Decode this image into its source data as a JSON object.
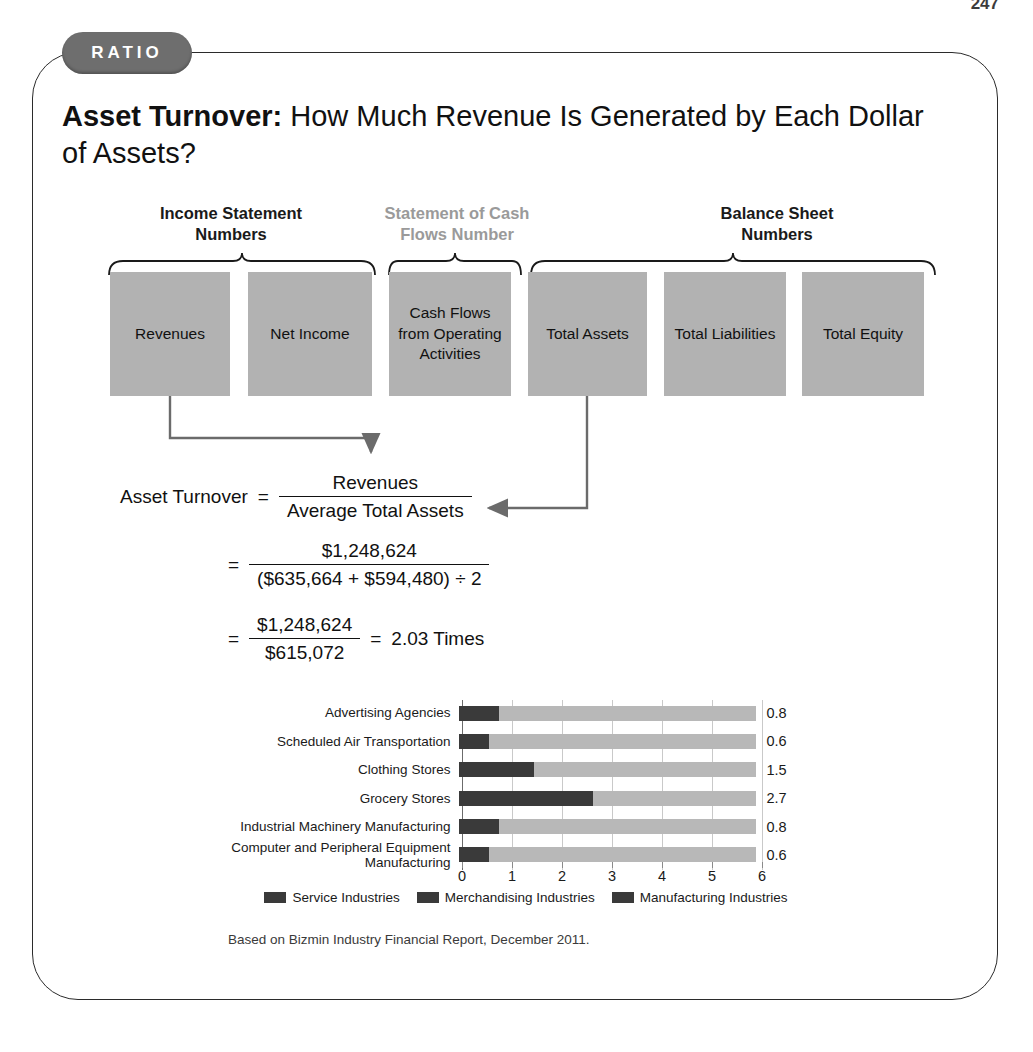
{
  "page_number": "247",
  "badge": {
    "label": "RATIO"
  },
  "title": {
    "lead": "Asset Turnover:",
    "rest": " How Much Revenue Is Generated by Each Dollar of Assets?"
  },
  "groups": [
    {
      "label": "Income Statement\nNumbers",
      "line1": "Income Statement",
      "line2": "Numbers",
      "muted": false
    },
    {
      "label": "Statement of Cash\nFlows Number",
      "line1": "Statement of Cash",
      "line2": "Flows Number",
      "muted": true
    },
    {
      "label": "Balance Sheet\nNumbers",
      "line1": "Balance Sheet",
      "line2": "Numbers",
      "muted": false
    }
  ],
  "boxes": [
    {
      "label": "Revenues"
    },
    {
      "label": "Net Income"
    },
    {
      "label": "Cash Flows from Operating Activities"
    },
    {
      "label": "Total Assets"
    },
    {
      "label": "Total Liabilities"
    },
    {
      "label": "Total Equity"
    }
  ],
  "formula": {
    "name": "Asset Turnover",
    "equals": "=",
    "numerator": "Revenues",
    "denominator": "Average Total Assets",
    "step2_numerator": "$1,248,624",
    "step2_denominator": "($635,664 + $594,480) ÷ 2",
    "step3_numerator": "$1,248,624",
    "step3_denominator": "$615,072",
    "result": "2.03 Times"
  },
  "chart_data": {
    "type": "bar",
    "orientation": "horizontal",
    "categories": [
      "Advertising Agencies",
      "Scheduled Air Transportation",
      "Clothing Stores",
      "Grocery Stores",
      "Industrial Machinery Manufacturing",
      "Computer and Peripheral Equipment Manufacturing"
    ],
    "values": [
      0.8,
      0.6,
      1.5,
      2.7,
      0.8,
      0.6
    ],
    "value_labels": [
      "0.8",
      "0.6",
      "1.5",
      "2.7",
      "0.8",
      "0.6"
    ],
    "series": [
      {
        "name": "Asset Turnover",
        "values": [
          0.8,
          0.6,
          1.5,
          2.7,
          0.8,
          0.6
        ]
      }
    ],
    "xlim": [
      0,
      6
    ],
    "xticks": [
      0,
      1,
      2,
      3,
      4,
      5,
      6
    ],
    "xtick_labels": [
      "0",
      "1",
      "2",
      "3",
      "4",
      "5",
      "6"
    ],
    "title": "",
    "xlabel": "",
    "ylabel": "",
    "grid": true,
    "legend_position": "bottom",
    "legend": [
      {
        "label": "Service Industries",
        "color": "#3a3a3a"
      },
      {
        "label": "Merchandising Industries",
        "color": "#3a3a3a"
      },
      {
        "label": "Manufacturing Industries",
        "color": "#3a3a3a"
      }
    ],
    "source_note": "Based on Bizmin Industry Financial Report, December 2011."
  },
  "colors": {
    "box_fill": "#b2b2b2",
    "bar_fill": "#3a3a3a",
    "bar_track": "#b8b8b8",
    "badge_bg": "#6e6e6e",
    "muted_text": "#9a9a9a",
    "frame_border": "#2b2b2b"
  }
}
